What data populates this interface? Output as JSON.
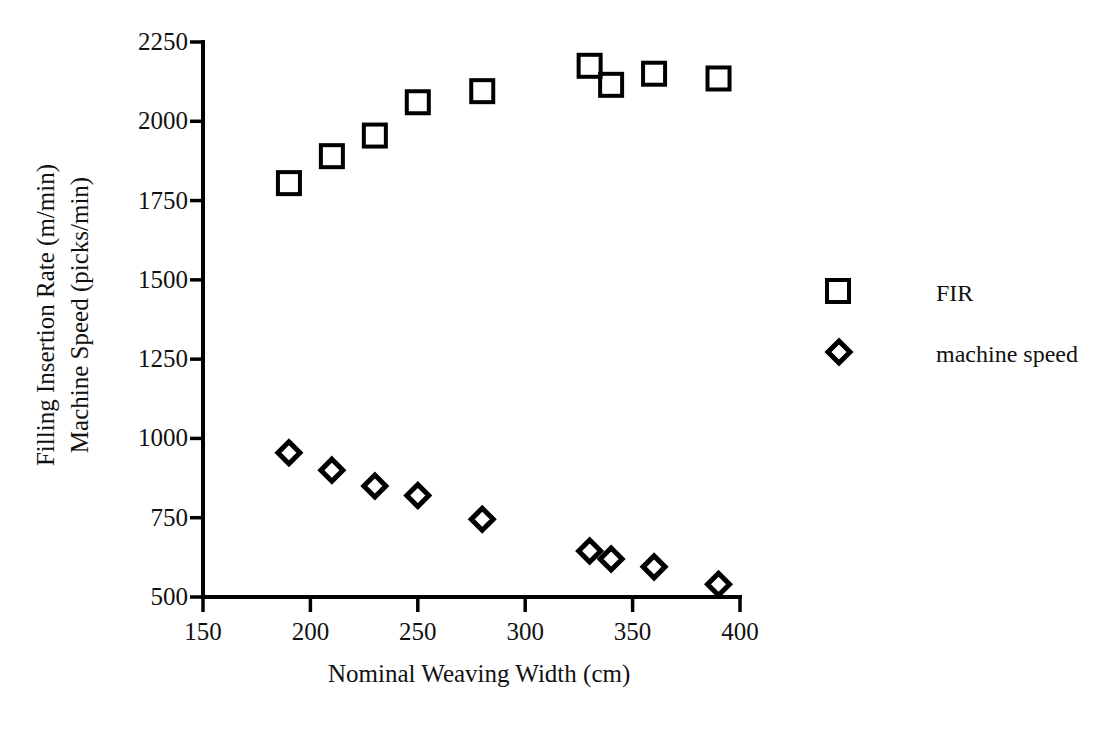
{
  "chart_data": {
    "type": "scatter",
    "title": "",
    "xlabel": "Nominal Weaving Width (cm)",
    "ylabel": "Filling Insertion Rate (m/min)\nMachine Speed (picks/min)",
    "ylabel_line1": "Filling Insertion Rate (m/min)",
    "ylabel_line2": "Machine Speed (picks/min)",
    "xlim": [
      150,
      400
    ],
    "ylim": [
      500,
      2250
    ],
    "xticks": [
      150,
      200,
      250,
      300,
      350,
      400
    ],
    "yticks": [
      500,
      750,
      1000,
      1250,
      1500,
      1750,
      2000,
      2250
    ],
    "xtick_labels": [
      "150",
      "200",
      "250",
      "300",
      "350",
      "400"
    ],
    "ytick_labels": [
      "500",
      "750",
      "1000",
      "1250",
      "1500",
      "1750",
      "2000",
      "2250"
    ],
    "grid": false,
    "legend_position": "right",
    "series": [
      {
        "name": "FIR",
        "marker": "square",
        "color": "#000000",
        "points": [
          {
            "x": 190,
            "y": 1805
          },
          {
            "x": 210,
            "y": 1890
          },
          {
            "x": 230,
            "y": 1955
          },
          {
            "x": 250,
            "y": 2060
          },
          {
            "x": 280,
            "y": 2095
          },
          {
            "x": 330,
            "y": 2175
          },
          {
            "x": 340,
            "y": 2115
          },
          {
            "x": 360,
            "y": 2150
          },
          {
            "x": 390,
            "y": 2135
          }
        ]
      },
      {
        "name": "machine speed",
        "marker": "diamond",
        "color": "#000000",
        "points": [
          {
            "x": 190,
            "y": 955
          },
          {
            "x": 210,
            "y": 900
          },
          {
            "x": 230,
            "y": 850
          },
          {
            "x": 250,
            "y": 820
          },
          {
            "x": 280,
            "y": 745
          },
          {
            "x": 330,
            "y": 645
          },
          {
            "x": 340,
            "y": 620
          },
          {
            "x": 360,
            "y": 595
          },
          {
            "x": 390,
            "y": 540
          }
        ]
      }
    ],
    "legend": [
      {
        "label": "FIR",
        "marker": "square"
      },
      {
        "label": "machine speed",
        "marker": "diamond"
      }
    ]
  }
}
